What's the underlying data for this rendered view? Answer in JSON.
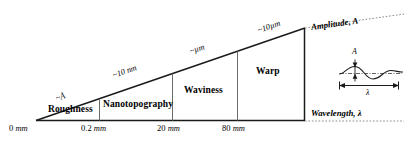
{
  "figure": {
    "type": "schematic-diagram",
    "bands": [
      {
        "id": "roughness",
        "label": "Roughness"
      },
      {
        "id": "nanotopography",
        "label": "Nanotopography"
      },
      {
        "id": "waviness",
        "label": "Waviness"
      },
      {
        "id": "warp",
        "label": "Warp"
      }
    ],
    "axis_ticks": [
      {
        "value": "0",
        "unit": "mm"
      },
      {
        "value": "0.2",
        "unit": "mm"
      },
      {
        "value": "20",
        "unit": "mm"
      },
      {
        "value": "80",
        "unit": "mm"
      }
    ],
    "magnitude_callouts": [
      {
        "id": "angstrom",
        "text": "~Å"
      },
      {
        "id": "ten-nm",
        "text": "~10 nm"
      },
      {
        "id": "micron",
        "text": "~µm"
      },
      {
        "id": "ten-um",
        "text": "~10µm"
      }
    ],
    "legend": [
      {
        "id": "amplitude",
        "text": "Amplitude, A"
      },
      {
        "id": "wavelength",
        "text": "Wavelength, λ"
      }
    ],
    "inset": {
      "amplitude_symbol": "A",
      "wavelength_symbol": "λ"
    },
    "colors": {
      "ink": "#1a1a1a",
      "divider": "#6b6b6b",
      "background": "#ffffff"
    }
  }
}
